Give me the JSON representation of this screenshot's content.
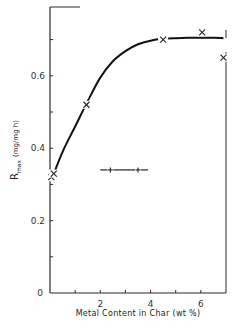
{
  "chart_data": {
    "type": "scatter",
    "title": "",
    "xlabel": "Metal Content in Char (wt %)",
    "ylabel": "R_max (mg/mg h)",
    "ylabel_main": "R",
    "ylabel_sub": "max",
    "ylabel_units": "(mg/mg h)",
    "xlim": [
      0,
      7
    ],
    "ylim": [
      0,
      0.79
    ],
    "x_ticks": [
      0,
      1,
      2,
      3,
      4,
      5,
      6
    ],
    "x_tick_labels": [
      "",
      "",
      "2",
      "",
      "4",
      "",
      "6"
    ],
    "y_ticks": [
      0,
      0.1,
      0.2,
      0.3,
      0.4,
      0.5,
      0.6,
      0.7
    ],
    "y_tick_labels": [
      "0",
      "",
      "0.2",
      "",
      "0.4",
      "",
      "0.6",
      ""
    ],
    "grid": false,
    "series": [
      {
        "name": "Measured R_max",
        "marker": "x",
        "x": [
          0.05,
          0.15,
          1.45,
          4.5,
          6.05,
          6.9
        ],
        "y": [
          0.32,
          0.33,
          0.52,
          0.7,
          0.72,
          0.65
        ]
      },
      {
        "name": "Fitted curve",
        "marker": "none",
        "line": "solid",
        "x": [
          0.1,
          0.5,
          1.0,
          1.5,
          2.0,
          2.5,
          3.0,
          3.5,
          4.0,
          4.5,
          5.0,
          5.5,
          6.0,
          6.5,
          6.9
        ],
        "y": [
          0.32,
          0.39,
          0.46,
          0.53,
          0.595,
          0.64,
          0.668,
          0.687,
          0.697,
          0.702,
          0.704,
          0.705,
          0.705,
          0.705,
          0.704
        ]
      }
    ],
    "error_bar": {
      "label": "typical error range",
      "orientation": "horizontal",
      "y": 0.34,
      "x_center": 2.95,
      "x_low": 2.0,
      "x_high": 3.9,
      "inner_marks": [
        2.4,
        3.5
      ]
    },
    "origin_label": "0"
  }
}
